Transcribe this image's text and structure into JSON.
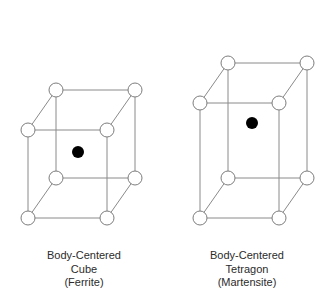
{
  "figure": {
    "background_color": "#ffffff",
    "edge_color": "#8a8a8a",
    "vertex_stroke_color": "#7d7d7d",
    "vertex_fill_color": "#ffffff",
    "center_atom_color": "#000000",
    "text_color": "#2b2b2b"
  },
  "structures": [
    {
      "id": "body-centered-cube",
      "caption_lines": [
        "Body-Centered",
        "Cube",
        "(Ferrite)"
      ],
      "lattice_type": "body-centered cubic",
      "corner_atom_count": 8,
      "center_atom_count": 1,
      "vertex_radius": 7,
      "center_radius": 6,
      "front_face": {
        "x": 28,
        "y": 130,
        "width": 79,
        "height": 88
      },
      "depth_offset": {
        "dx": 28,
        "dy": -40
      },
      "center_atom": {
        "cx": 78,
        "cy": 152
      }
    },
    {
      "id": "body-centered-tetragon",
      "caption_lines": [
        "Body-Centered",
        "Tetragon",
        "(Martensite)"
      ],
      "lattice_type": "body-centered tetragonal",
      "corner_atom_count": 8,
      "center_atom_count": 1,
      "vertex_radius": 7,
      "center_radius": 6,
      "front_face": {
        "x": 200,
        "y": 103,
        "width": 79,
        "height": 115
      },
      "depth_offset": {
        "dx": 28,
        "dy": -40
      },
      "center_atom": {
        "cx": 252,
        "cy": 123
      }
    }
  ]
}
